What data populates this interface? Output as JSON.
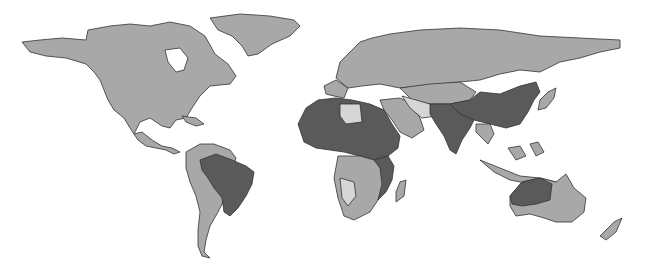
{
  "map": {
    "type": "choropleth",
    "projection": "equirectangular-like world",
    "background": "#ffffff",
    "classes": [
      {
        "name": "light",
        "color": "#d6d6d6"
      },
      {
        "name": "medium",
        "color": "#a8a8a8"
      },
      {
        "name": "dark",
        "color": "#5a5a5a"
      }
    ],
    "border_color": "#333333",
    "regions": [
      {
        "name": "North America",
        "class": "medium"
      },
      {
        "name": "Greenland",
        "class": "medium"
      },
      {
        "name": "Central America",
        "class": "medium"
      },
      {
        "name": "South America (non-Brazil)",
        "class": "medium"
      },
      {
        "name": "Brazil",
        "class": "dark"
      },
      {
        "name": "Europe",
        "class": "medium"
      },
      {
        "name": "Russia",
        "class": "medium"
      },
      {
        "name": "Central Asia",
        "class": "medium"
      },
      {
        "name": "China",
        "class": "dark"
      },
      {
        "name": "India / South Asia",
        "class": "dark"
      },
      {
        "name": "Southeast Asia",
        "class": "medium"
      },
      {
        "name": "Japan",
        "class": "medium"
      },
      {
        "name": "Middle East",
        "class": "medium"
      },
      {
        "name": "Iran / Afghanistan",
        "class": "light"
      },
      {
        "name": "Libya",
        "class": "light"
      },
      {
        "name": "North/West Africa",
        "class": "dark"
      },
      {
        "name": "East Africa",
        "class": "dark"
      },
      {
        "name": "Central/Southern Africa",
        "class": "medium"
      },
      {
        "name": "Namibia / Zambia",
        "class": "light"
      },
      {
        "name": "Madagascar",
        "class": "medium"
      },
      {
        "name": "Australia (east)",
        "class": "medium"
      },
      {
        "name": "Australia (north-west)",
        "class": "dark"
      },
      {
        "name": "New Zealand",
        "class": "medium"
      }
    ]
  }
}
